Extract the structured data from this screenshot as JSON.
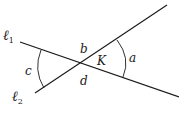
{
  "diagram": {
    "lines": [
      {
        "id": "l1",
        "label": "ℓ",
        "subscript": "1",
        "from": [
          20,
          42
        ],
        "to": [
          179,
          97
        ]
      },
      {
        "id": "l2",
        "label": "ℓ",
        "subscript": "2",
        "from": [
          35,
          93
        ],
        "to": [
          167,
          5
        ]
      }
    ],
    "intersection": {
      "label": "K",
      "point": [
        82,
        63
      ]
    },
    "angle_labels": {
      "a": "a",
      "b": "b",
      "c": "c",
      "d": "d"
    },
    "colors": {
      "stroke": "#1a1a1a",
      "background": "#ffffff"
    }
  }
}
